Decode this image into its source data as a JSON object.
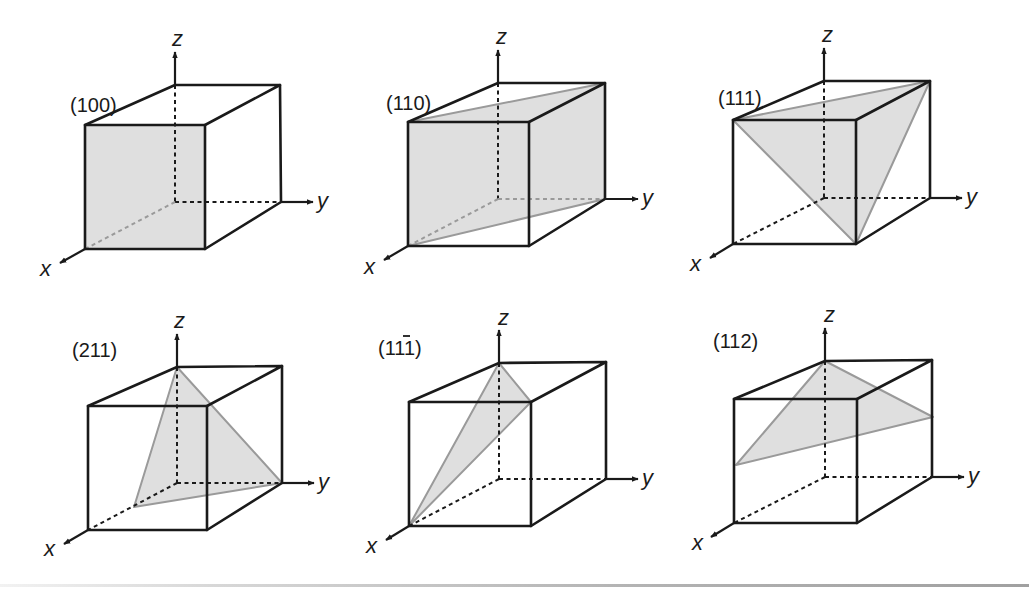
{
  "figure": {
    "colors": {
      "plane_fill": "#d9d9d9",
      "plane_edge": "#9a9a9a",
      "cube_edge": "#1a1a1a"
    },
    "axes": {
      "x": "x",
      "y": "y",
      "z": "z"
    },
    "panels": [
      {
        "id": "p100",
        "label": "(100)",
        "label_parts": [
          "(",
          "1",
          "0",
          "0",
          ")"
        ],
        "bar_index": -1
      },
      {
        "id": "p110",
        "label": "(110)",
        "label_parts": [
          "(",
          "1",
          "1",
          "0",
          ")"
        ],
        "bar_index": -1
      },
      {
        "id": "p111",
        "label": "(111)",
        "label_parts": [
          "(",
          "1",
          "1",
          "1",
          ")"
        ],
        "bar_index": -1
      },
      {
        "id": "p211",
        "label": "(211)",
        "label_parts": [
          "(",
          "2",
          "1",
          "1",
          ")"
        ],
        "bar_index": -1
      },
      {
        "id": "p1m11",
        "label": "(1̅1̄1)",
        "label_parts": [
          "(",
          "1",
          "1",
          "1",
          ")"
        ],
        "bar_index": 2
      },
      {
        "id": "p112",
        "label": "(112)",
        "label_parts": [
          "(",
          "1",
          "1",
          "2",
          ")"
        ],
        "bar_index": -1
      }
    ]
  }
}
